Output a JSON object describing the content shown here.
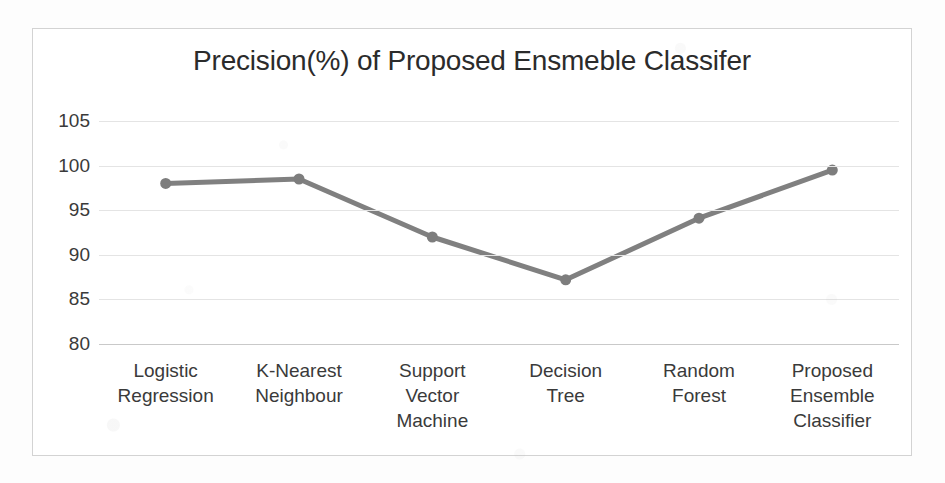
{
  "chart_data": {
    "type": "line",
    "title": "Precision(%) of Proposed Ensmeble Classifer",
    "xlabel": "",
    "ylabel": "",
    "categories": [
      "Logistic Regression",
      "K-Nearest Neighbour",
      "Support Vector Machine",
      "Decision Tree",
      "Random Forest",
      "Proposed Ensemble Classifier"
    ],
    "category_lines": [
      [
        "Logistic",
        "Regression"
      ],
      [
        "K-Nearest",
        "Neighbour"
      ],
      [
        "Support",
        "Vector",
        "Machine"
      ],
      [
        "Decision",
        "Tree"
      ],
      [
        "Random",
        "Forest"
      ],
      [
        "Proposed",
        "Ensemble",
        "Classifier"
      ]
    ],
    "values": [
      98.0,
      98.5,
      92.0,
      87.2,
      94.1,
      99.5
    ],
    "ylim": [
      80,
      105
    ],
    "yticks": [
      105,
      100,
      95,
      90,
      85,
      80
    ],
    "ytick_labels": [
      "105",
      "100",
      "95",
      "90",
      "85",
      "80"
    ],
    "grid": true,
    "legend": false,
    "legend_position": "none",
    "series_color": "#808080",
    "marker": "circle",
    "colors": {
      "line": "#808080",
      "marker": "#7d7d7d",
      "grid": "#e4e4e4",
      "axis": "#c9c9c9",
      "text": "#3a3a3a",
      "title_text": "#2b2b2b",
      "frame": "#d3d3d3",
      "background": "#ffffff"
    }
  }
}
